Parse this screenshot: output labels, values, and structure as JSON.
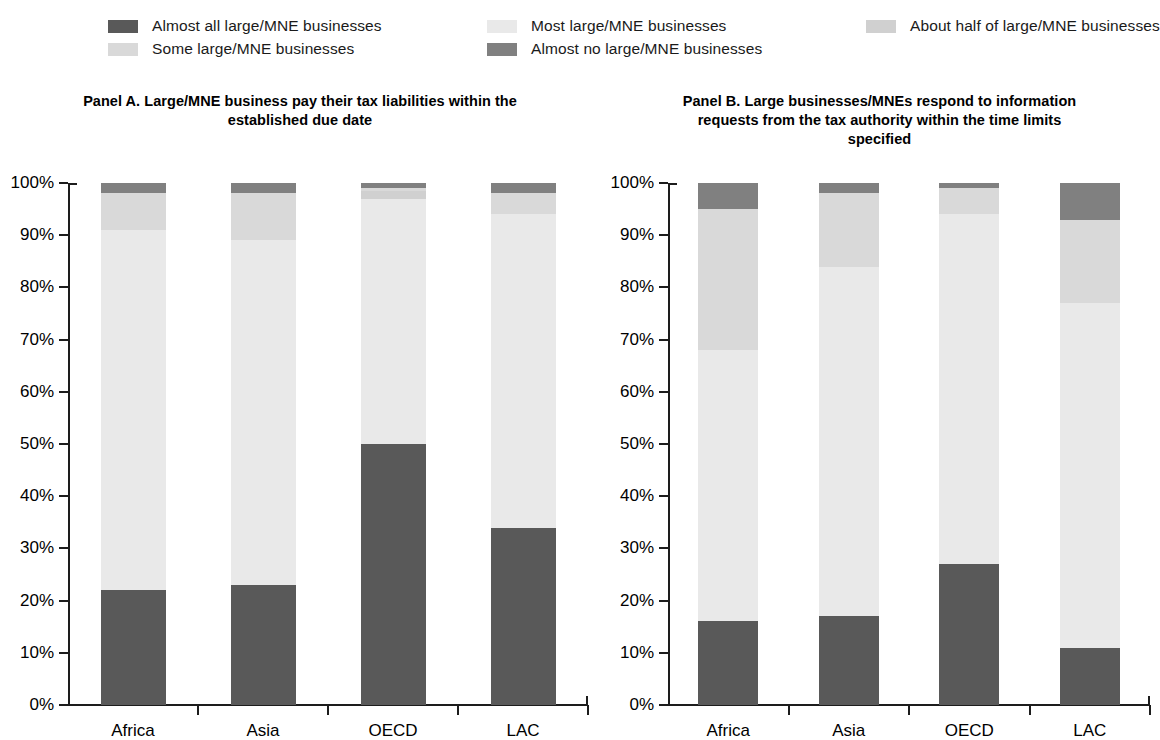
{
  "legend": {
    "items": [
      {
        "label": "Almost all large/MNE businesses",
        "color": "#595959",
        "key": "almost_all"
      },
      {
        "label": "Some large/MNE businesses",
        "color": "#d9d9d9",
        "key": "some"
      },
      {
        "label": "Most large/MNE businesses",
        "color": "#e9e9e9",
        "key": "most"
      },
      {
        "label": "Almost no large/MNE businesses",
        "color": "#808080",
        "key": "almost_no"
      },
      {
        "label": "About half of large/MNE businesses",
        "color": "#d0d0d0",
        "key": "about_half"
      }
    ]
  },
  "chart_data": [
    {
      "type": "bar",
      "id": "panel-a",
      "title": "Panel A. Large/MNE business pay their tax liabilities within the established due date",
      "xlabel": "",
      "ylabel": "",
      "ylim": [
        0,
        100
      ],
      "ytick_labels": [
        "0%",
        "10%",
        "20%",
        "30%",
        "40%",
        "50%",
        "60%",
        "70%",
        "80%",
        "90%",
        "100%"
      ],
      "ytick_values": [
        0,
        10,
        20,
        30,
        40,
        50,
        60,
        70,
        80,
        90,
        100
      ],
      "grid": false,
      "stacked": true,
      "legend_position": "top",
      "categories": [
        "Africa",
        "Asia",
        "OECD",
        "LAC"
      ],
      "series": [
        {
          "name": "Almost all large/MNE businesses",
          "color": "#595959",
          "values": [
            22.0,
            23.0,
            50.0,
            34.0
          ]
        },
        {
          "name": "Most large/MNE businesses",
          "color": "#e9e9e9",
          "values": [
            69.0,
            66.0,
            47.0,
            60.0
          ]
        },
        {
          "name": "About half of large/MNE businesses",
          "color": "#d0d0d0",
          "values": [
            0.0,
            0.0,
            1.5,
            0.0
          ]
        },
        {
          "name": "Some large/MNE businesses",
          "color": "#d9d9d9",
          "values": [
            7.0,
            9.0,
            0.5,
            4.0
          ]
        },
        {
          "name": "Almost no large/MNE businesses",
          "color": "#808080",
          "values": [
            2.0,
            2.0,
            1.0,
            2.0
          ]
        }
      ]
    },
    {
      "type": "bar",
      "id": "panel-b",
      "title": "Panel B. Large businesses/MNEs respond to information requests from the tax authority within the time limits specified",
      "xlabel": "",
      "ylabel": "",
      "ylim": [
        0,
        100
      ],
      "ytick_labels": [
        "0%",
        "10%",
        "20%",
        "30%",
        "40%",
        "50%",
        "60%",
        "70%",
        "80%",
        "90%",
        "100%"
      ],
      "ytick_values": [
        0,
        10,
        20,
        30,
        40,
        50,
        60,
        70,
        80,
        90,
        100
      ],
      "grid": false,
      "stacked": true,
      "legend_position": "top",
      "categories": [
        "Africa",
        "Asia",
        "OECD",
        "LAC"
      ],
      "series": [
        {
          "name": "Almost all large/MNE businesses",
          "color": "#595959",
          "values": [
            16.0,
            17.0,
            27.0,
            11.0
          ]
        },
        {
          "name": "Most large/MNE businesses",
          "color": "#e9e9e9",
          "values": [
            52.0,
            67.0,
            67.0,
            66.0
          ]
        },
        {
          "name": "About half of large/MNE businesses",
          "color": "#d0d0d0",
          "values": [
            0.0,
            0.0,
            0.0,
            0.0
          ]
        },
        {
          "name": "Some large/MNE businesses",
          "color": "#d9d9d9",
          "values": [
            27.0,
            14.0,
            5.0,
            16.0
          ]
        },
        {
          "name": "Almost no large/MNE businesses",
          "color": "#808080",
          "values": [
            5.0,
            2.0,
            1.0,
            7.0
          ]
        }
      ]
    }
  ]
}
